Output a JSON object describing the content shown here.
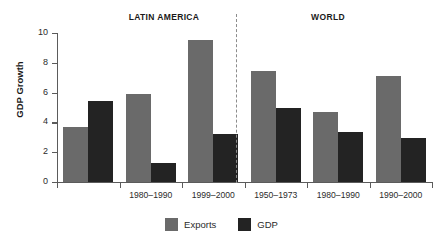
{
  "chart_data": {
    "type": "bar",
    "title": "",
    "xlabel": "",
    "ylabel": "GDP Growth",
    "ylim": [
      0,
      10
    ],
    "yticks": [
      0,
      2,
      4,
      6,
      8,
      10
    ],
    "grid": false,
    "legend_position": "bottom-center",
    "panels": [
      {
        "label": "LATIN AMERICA"
      },
      {
        "label": "WORLD"
      }
    ],
    "categories": [
      "",
      "1980–1990",
      "1999–2000",
      "1950–1973",
      "1980–1990",
      "1990–2000"
    ],
    "series": [
      {
        "name": "Exports",
        "color": "#6a6a6a",
        "values": [
          3.7,
          5.9,
          9.55,
          7.45,
          4.7,
          7.1
        ]
      },
      {
        "name": "GDP",
        "color": "#232323",
        "values": [
          5.45,
          1.3,
          3.25,
          4.95,
          3.35,
          2.95
        ]
      }
    ],
    "divider": {
      "after_category_index": 2,
      "style": "dashed",
      "color": "#8c8c8c"
    }
  },
  "axis": {
    "y_label": "GDP Growth",
    "y_ticks": [
      "10",
      "8",
      "6",
      "4",
      "2",
      "0"
    ]
  },
  "panels": {
    "latin_america": "LATIN AMERICA",
    "world": "WORLD"
  },
  "x_labels": [
    "",
    "1980–1990",
    "1999–2000",
    "1950–1973",
    "1980–1990",
    "1990–2000"
  ],
  "legend": {
    "items": [
      {
        "label": "Exports",
        "color": "#6a6a6a"
      },
      {
        "label": "GDP",
        "color": "#232323"
      }
    ]
  }
}
